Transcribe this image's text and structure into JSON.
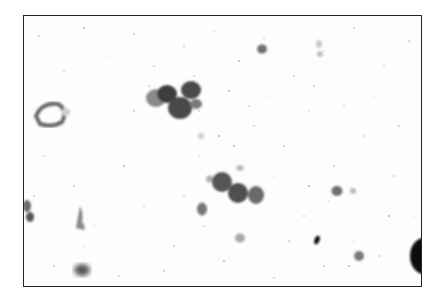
{
  "image": {
    "description": "Grayscale cytology micrograph showing clusters of cells with dark nuclei on a speckled light background",
    "colors": {
      "background": "#fdfdfd",
      "border": "#222222",
      "nucleus_dark": "#3a3a3a",
      "nucleus_mid": "#6a6a6a",
      "nucleus_light": "#9a9a9a"
    }
  }
}
